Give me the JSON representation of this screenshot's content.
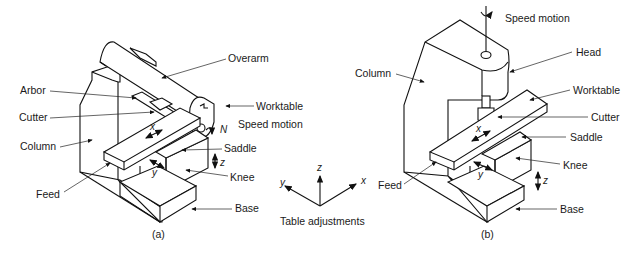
{
  "figure": {
    "panel_a": {
      "caption": "(a)",
      "labels": {
        "overarm": "Overarm",
        "arbor": "Arbor",
        "cutter": "Cutter",
        "column": "Column",
        "feed": "Feed",
        "worktable": "Worktable",
        "speed_motion": "Speed motion",
        "n": "N",
        "saddle": "Saddle",
        "knee": "Knee",
        "base": "Base",
        "x": "x",
        "y": "y",
        "z": "z"
      }
    },
    "axes": {
      "caption": "Table adjustments",
      "x": "x",
      "y": "y",
      "z": "z"
    },
    "panel_b": {
      "caption": "(b)",
      "labels": {
        "speed_motion": "Speed motion",
        "head": "Head",
        "column": "Column",
        "worktable": "Worktable",
        "cutter": "Cutter",
        "saddle": "Saddle",
        "knee": "Knee",
        "feed": "Feed",
        "base": "Base",
        "x": "x",
        "y": "y",
        "z": "z"
      }
    }
  }
}
